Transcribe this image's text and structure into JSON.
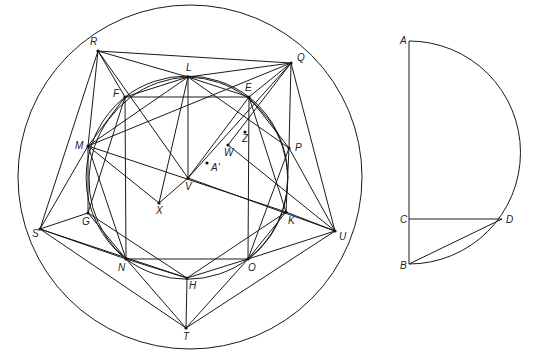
{
  "figure_left": {
    "outer_circle": {
      "cx": 190,
      "cy": 177,
      "r": 172
    },
    "inner_circle": {
      "cx": 190,
      "cy": 177,
      "r": 103
    },
    "points": {
      "R": {
        "x": 98,
        "y": 51,
        "label": "R",
        "lx": -8,
        "ly": -6
      },
      "Q": {
        "x": 291,
        "y": 63,
        "label": "Q",
        "lx": 6,
        "ly": -2
      },
      "L": {
        "x": 188,
        "y": 77,
        "label": "L",
        "lx": -2,
        "ly": -6
      },
      "F": {
        "x": 125,
        "y": 97,
        "label": "F",
        "lx": -12,
        "ly": 0
      },
      "E": {
        "x": 249,
        "y": 97,
        "label": "E",
        "lx": -4,
        "ly": -6
      },
      "M": {
        "x": 88,
        "y": 146,
        "label": "M",
        "lx": -13,
        "ly": 3
      },
      "P": {
        "x": 289,
        "y": 148,
        "label": "P",
        "lx": 6,
        "ly": 3
      },
      "Z": {
        "x": 245,
        "y": 132,
        "label": "Z",
        "lx": -3,
        "ly": 10
      },
      "W": {
        "x": 228,
        "y": 145,
        "label": "W",
        "lx": -4,
        "ly": 11
      },
      "A'": {
        "x": 207,
        "y": 163,
        "label": "A'",
        "lx": 4,
        "ly": 8
      },
      "V": {
        "x": 188,
        "y": 178,
        "label": "V",
        "lx": -3,
        "ly": 12
      },
      "X": {
        "x": 159,
        "y": 203,
        "label": "X",
        "lx": -3,
        "ly": 11
      },
      "G": {
        "x": 88,
        "y": 213,
        "label": "G",
        "lx": -6,
        "ly": 12
      },
      "K": {
        "x": 286,
        "y": 212,
        "label": "K",
        "lx": 2,
        "ly": 12
      },
      "S": {
        "x": 40,
        "y": 229,
        "label": "S",
        "lx": -8,
        "ly": 8
      },
      "U": {
        "x": 335,
        "y": 231,
        "label": "U",
        "lx": 4,
        "ly": 9
      },
      "N": {
        "x": 126,
        "y": 259,
        "label": "N",
        "lx": -8,
        "ly": 12
      },
      "O": {
        "x": 248,
        "y": 259,
        "label": "O",
        "lx": 0,
        "ly": 12
      },
      "H": {
        "x": 187,
        "y": 278,
        "label": "H",
        "lx": 2,
        "ly": 11
      },
      "T": {
        "x": 186,
        "y": 328,
        "label": "T",
        "lx": -3,
        "ly": 12
      }
    }
  },
  "figure_right": {
    "points": {
      "A": {
        "x": 409,
        "y": 41,
        "label": "A",
        "lx": -9,
        "ly": 3
      },
      "C": {
        "x": 409,
        "y": 219,
        "label": "C",
        "lx": -9,
        "ly": 4
      },
      "D": {
        "x": 502,
        "y": 219,
        "label": "D",
        "lx": 4,
        "ly": 4
      },
      "B": {
        "x": 409,
        "y": 264,
        "label": "B",
        "lx": -9,
        "ly": 5
      }
    }
  }
}
